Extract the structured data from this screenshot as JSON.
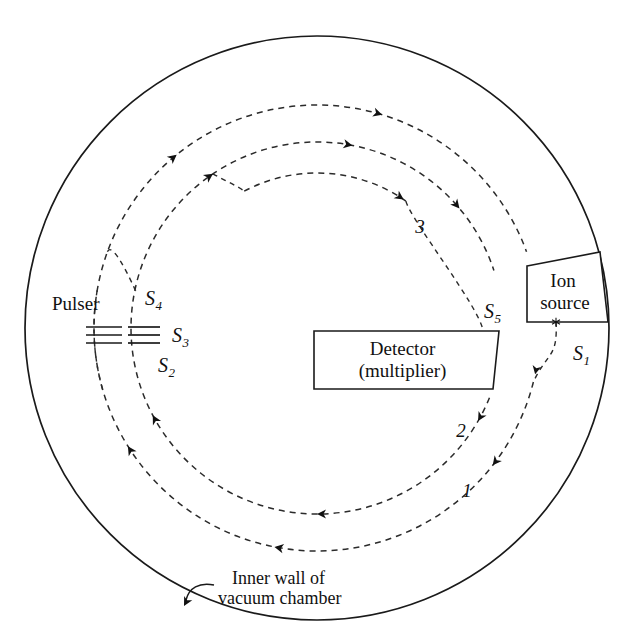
{
  "figure": {
    "background_color": "#ffffff",
    "line_color": "#1a1a1a",
    "dash_color": "#2b2b2b",
    "width": 638,
    "height": 642
  },
  "geometry": {
    "center": {
      "x": 317,
      "y": 328
    },
    "chamber_radius": 292,
    "orbit_outer_radius": 223,
    "orbit_inner_radius": 186
  },
  "labels": {
    "pulser": "Pulser",
    "ion_source_line1": "Ion",
    "ion_source_line2": "source",
    "detector_line1": "Detector",
    "detector_line2": "(multiplier)",
    "caption_line1": "Inner wall of",
    "caption_line2": "vacuum chamber"
  },
  "section_labels": [
    {
      "id": "S1",
      "base": "S",
      "sub": "1",
      "x": 573,
      "y": 360
    },
    {
      "id": "S2",
      "base": "S",
      "sub": "2",
      "x": 158,
      "y": 372
    },
    {
      "id": "S3",
      "base": "S",
      "sub": "3",
      "x": 172,
      "y": 342
    },
    {
      "id": "S4",
      "base": "S",
      "sub": "4",
      "x": 145,
      "y": 305
    },
    {
      "id": "S5",
      "base": "S",
      "sub": "5",
      "x": 484,
      "y": 318
    }
  ],
  "turn_labels": [
    {
      "id": "turn-1",
      "text": "1",
      "x": 467,
      "y": 497
    },
    {
      "id": "turn-2",
      "text": "2",
      "x": 461,
      "y": 437
    },
    {
      "id": "turn-3",
      "text": "3",
      "x": 420,
      "y": 233
    }
  ],
  "detector": {
    "x": 314,
    "y": 331,
    "width": 185,
    "height": 58,
    "skew": 6
  },
  "ion_source": {
    "points": "527,266 600,252 608,322 527,322",
    "exit_marker": {
      "x": 556,
      "y": 322
    }
  },
  "pulser": {
    "left_plate_x1": 86,
    "left_plate_x2": 122,
    "right_plate_x1": 128,
    "right_plate_x2": 160,
    "plate_rows_y": [
      327,
      335,
      343
    ],
    "label_x": 52,
    "label_y": 310
  },
  "caption": {
    "text_x": 232,
    "text_y1": 584,
    "text_y2": 604,
    "arrow_path": "M 214 585 C 199 582 189 588 186 600",
    "arrow_tip": {
      "x": 184,
      "y": 606,
      "angle": 118
    }
  },
  "trajectories": {
    "outer_label": "outer orbit (turn 1 / S1 entry path)",
    "inner_label": "inner orbit (turns 2 and 3)",
    "arrow_marks": [
      {
        "id": "arrow-top-outer",
        "angle": -75,
        "radius": 223,
        "dir": "cw"
      },
      {
        "id": "arrow-top-inner",
        "angle": -72,
        "radius": 186,
        "dir": "cw"
      },
      {
        "id": "arrow-upperleft-outer",
        "angle": -135,
        "radius": 223,
        "dir": "ccw-up"
      },
      {
        "id": "arrow-upperleft-inner",
        "angle": -132,
        "radius": 186,
        "dir": "ccw-up"
      },
      {
        "id": "arrow-lowerleft-outer",
        "angle": 140,
        "radius": 223,
        "dir": "up"
      },
      {
        "id": "arrow-lowerleft-inner",
        "angle": 144,
        "radius": 186,
        "dir": "up"
      },
      {
        "id": "arrow-bottom-outer",
        "angle": 96,
        "radius": 223,
        "dir": "left"
      },
      {
        "id": "arrow-bottom-inner",
        "angle": 86,
        "radius": 186,
        "dir": "left"
      },
      {
        "id": "arrow-right-outer",
        "angle": 40,
        "radius": 223,
        "dir": "down"
      },
      {
        "id": "arrow-right-inner",
        "angle": 34,
        "radius": 186,
        "dir": "down"
      },
      {
        "id": "arrow-upperright-inner",
        "angle": -42,
        "radius": 186,
        "dir": "down"
      },
      {
        "id": "arrow-turn3",
        "angle": -58,
        "radius": 155,
        "dir": "down"
      }
    ]
  }
}
